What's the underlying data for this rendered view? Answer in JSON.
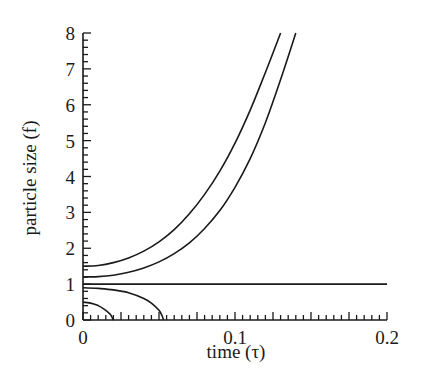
{
  "chart_data": {
    "type": "line",
    "title": "",
    "xlabel": "time (τ)",
    "ylabel": "particle size (f)",
    "xlim": [
      0,
      0.2
    ],
    "ylim": [
      0,
      8
    ],
    "x_ticks": [
      0,
      0.1,
      0.2
    ],
    "x_tick_labels": [
      "0",
      "0.1",
      "0.2"
    ],
    "y_ticks": [
      0,
      1,
      2,
      3,
      4,
      5,
      6,
      7,
      8
    ],
    "y_tick_labels": [
      "0",
      "1",
      "2",
      "3",
      "4",
      "5",
      "6",
      "7",
      "8"
    ],
    "x_minor_step": 0.005,
    "y_minor_step": 0.2,
    "grid": false,
    "legend": null,
    "series": [
      {
        "name": "f0 = 1.5 (growth)",
        "x": [
          0,
          0.01,
          0.02,
          0.03,
          0.04,
          0.05,
          0.06,
          0.07,
          0.08,
          0.09,
          0.1,
          0.11,
          0.12,
          0.13
        ],
        "values": [
          1.5,
          1.52,
          1.6,
          1.73,
          1.92,
          2.18,
          2.52,
          2.96,
          3.5,
          4.15,
          4.93,
          5.85,
          6.9,
          8.0
        ]
      },
      {
        "name": "f0 = 1.2 (growth)",
        "x": [
          0,
          0.01,
          0.02,
          0.03,
          0.04,
          0.05,
          0.06,
          0.07,
          0.08,
          0.09,
          0.1,
          0.11,
          0.12,
          0.13,
          0.14
        ],
        "values": [
          1.2,
          1.21,
          1.25,
          1.33,
          1.45,
          1.62,
          1.85,
          2.15,
          2.55,
          3.05,
          3.7,
          4.5,
          5.5,
          6.7,
          8.0
        ]
      },
      {
        "name": "f0 = 1.0 (steady)",
        "x": [
          0,
          0.2
        ],
        "values": [
          1.0,
          1.0
        ]
      },
      {
        "name": "f0 = 0.9 (dissolution)",
        "x": [
          0,
          0.01,
          0.02,
          0.03,
          0.04,
          0.045,
          0.05,
          0.052,
          0.053
        ],
        "values": [
          0.9,
          0.88,
          0.84,
          0.76,
          0.6,
          0.47,
          0.27,
          0.12,
          0.0
        ]
      },
      {
        "name": "f0 = 0.5 (dissolution)",
        "x": [
          0,
          0.005,
          0.01,
          0.015,
          0.018,
          0.02
        ],
        "values": [
          0.5,
          0.47,
          0.4,
          0.27,
          0.15,
          0.0
        ]
      }
    ]
  }
}
